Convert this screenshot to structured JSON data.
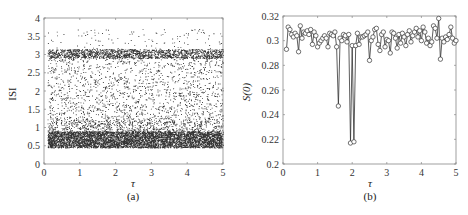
{
  "chart_data": [
    {
      "type": "scatter",
      "panel_label": "(a)",
      "title": "",
      "xlabel": "τ",
      "ylabel": "ISI",
      "xlim": [
        0,
        5
      ],
      "ylim": [
        0,
        4
      ],
      "xticks": [
        0,
        1,
        2,
        3,
        4,
        5
      ],
      "yticks": [
        0,
        0.5,
        1,
        1.5,
        2,
        2.5,
        3,
        3.5,
        4
      ],
      "ytick_labels": [
        "0",
        "0.5",
        "1",
        "1.5",
        "2",
        "2.5",
        "3",
        "3.5",
        "4"
      ],
      "grid": false,
      "marker": "dot",
      "color": "#111111",
      "description": "Dense scatter of inter-spike intervals vs τ (τ from ~0.1 to 5). Very dense band between ISI 0.45 and 0.9, dense band around ISI 2.95–3.15, sparse scattered points between 1 and 2.9, and a few outliers between 3.2 and 3.7.",
      "density_bands": [
        {
          "ymin": 0.45,
          "ymax": 0.9,
          "count": 5200
        },
        {
          "ymin": 0.9,
          "ymax": 1.2,
          "count": 700
        },
        {
          "ymin": 1.2,
          "ymax": 2.9,
          "count": 1500
        },
        {
          "ymin": 2.9,
          "ymax": 3.15,
          "count": 1600
        },
        {
          "ymin": 3.15,
          "ymax": 3.7,
          "count": 110
        }
      ],
      "x_range_of_points": [
        0.1,
        5.0
      ]
    },
    {
      "type": "line",
      "panel_label": "(b)",
      "title": "",
      "xlabel": "τ",
      "ylabel": "S(0)",
      "xlim": [
        0,
        5
      ],
      "ylim": [
        0.2,
        0.32
      ],
      "xticks": [
        0,
        1,
        2,
        3,
        4,
        5
      ],
      "yticks": [
        0.2,
        0.22,
        0.24,
        0.26,
        0.28,
        0.3,
        0.32
      ],
      "ytick_labels": [
        "0.2",
        "0.22",
        "0.24",
        "0.26",
        "0.28",
        "0.3",
        "0.32"
      ],
      "grid": false,
      "marker": "open-circle",
      "color": "#222222",
      "x": [
        0.1,
        0.15,
        0.2,
        0.25,
        0.3,
        0.35,
        0.4,
        0.45,
        0.5,
        0.55,
        0.6,
        0.65,
        0.7,
        0.75,
        0.8,
        0.85,
        0.9,
        0.95,
        1.0,
        1.05,
        1.1,
        1.15,
        1.2,
        1.25,
        1.3,
        1.35,
        1.4,
        1.45,
        1.5,
        1.55,
        1.6,
        1.65,
        1.7,
        1.75,
        1.8,
        1.85,
        1.9,
        1.95,
        2.0,
        2.05,
        2.1,
        2.15,
        2.2,
        2.25,
        2.3,
        2.35,
        2.4,
        2.45,
        2.5,
        2.55,
        2.6,
        2.65,
        2.7,
        2.75,
        2.8,
        2.85,
        2.9,
        2.95,
        3.0,
        3.05,
        3.1,
        3.15,
        3.2,
        3.25,
        3.3,
        3.35,
        3.4,
        3.45,
        3.5,
        3.55,
        3.6,
        3.65,
        3.7,
        3.75,
        3.8,
        3.85,
        3.9,
        3.95,
        4.0,
        4.05,
        4.1,
        4.15,
        4.2,
        4.25,
        4.3,
        4.35,
        4.4,
        4.45,
        4.5,
        4.55,
        4.6,
        4.65,
        4.7,
        4.75,
        4.8,
        4.85,
        4.9,
        4.95,
        5.0
      ],
      "values": [
        0.293,
        0.311,
        0.309,
        0.305,
        0.303,
        0.306,
        0.304,
        0.291,
        0.312,
        0.302,
        0.307,
        0.306,
        0.308,
        0.305,
        0.309,
        0.297,
        0.307,
        0.304,
        0.295,
        0.298,
        0.3,
        0.302,
        0.304,
        0.302,
        0.295,
        0.306,
        0.305,
        0.304,
        0.307,
        0.295,
        0.247,
        0.302,
        0.3,
        0.305,
        0.304,
        0.299,
        0.305,
        0.217,
        0.296,
        0.218,
        0.296,
        0.306,
        0.297,
        0.303,
        0.303,
        0.304,
        0.305,
        0.307,
        0.284,
        0.3,
        0.303,
        0.309,
        0.31,
        0.297,
        0.292,
        0.305,
        0.307,
        0.295,
        0.301,
        0.3,
        0.29,
        0.307,
        0.306,
        0.302,
        0.294,
        0.305,
        0.298,
        0.306,
        0.303,
        0.296,
        0.305,
        0.308,
        0.299,
        0.304,
        0.307,
        0.31,
        0.303,
        0.308,
        0.3,
        0.311,
        0.307,
        0.298,
        0.302,
        0.296,
        0.299,
        0.312,
        0.31,
        0.302,
        0.318,
        0.285,
        0.302,
        0.299,
        0.303,
        0.301,
        0.305,
        0.311,
        0.302,
        0.298,
        0.3
      ]
    }
  ],
  "panels": {
    "a": {
      "label": "(a)",
      "xlabel": "τ",
      "ylabel": "ISI"
    },
    "b": {
      "label": "(b)",
      "xlabel": "τ",
      "ylabel": "S(0)"
    }
  }
}
